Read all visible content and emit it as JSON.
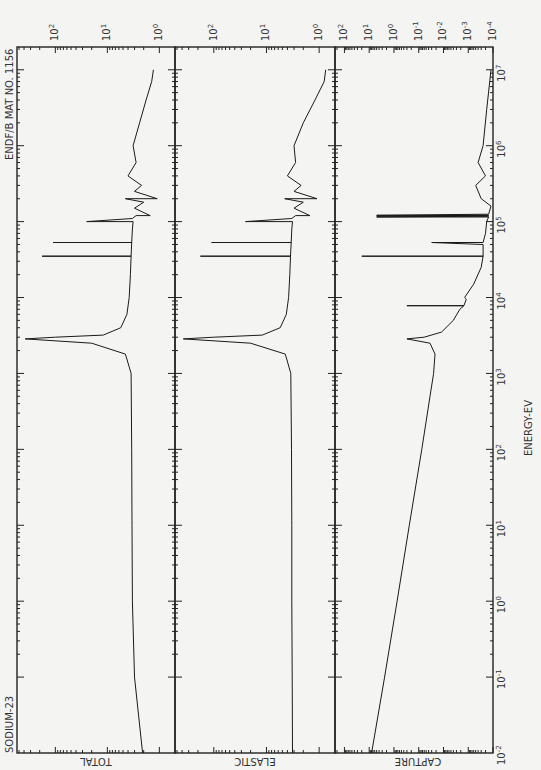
{
  "chart_data": {
    "type": "line",
    "orientation": "rotated-90-clockwise",
    "title_left": "SODIUM-23",
    "title_right": "ENDF/B MAT NO. 1156",
    "xlabel": "ENERGY-EV",
    "x_scale": "log",
    "x_range": [
      0.01,
      10000000
    ],
    "x_ticks": [
      "10^-2",
      "10^-1",
      "10^0",
      "10^1",
      "10^2",
      "10^3",
      "10^4",
      "10^5",
      "10^6",
      "10^7"
    ],
    "panels": [
      {
        "name": "TOTAL",
        "ylabel": "TOTAL",
        "y_scale": "log",
        "y_ticks": [
          "10^0",
          "10^1",
          "10^2"
        ],
        "y_range": [
          0.5,
          500
        ],
        "series": [
          {
            "name": "total cross section",
            "x": [
              0.01,
              0.1,
              1,
              10,
              100,
              1000,
              1800,
              2500,
              2850,
              3000,
              3200,
              4000,
              6000,
              10000,
              20000,
              35000,
              35000,
              35001,
              53000,
              53000,
              53001,
              80000,
              100000,
              100000,
              110000,
              120000,
              120001,
              150000,
              180000,
              200000,
              200001,
              250000,
              300000,
              400000,
              600000,
              1000000,
              2000000,
              4000000,
              7000000,
              10000000
            ],
            "y": [
              2.1,
              3.0,
              3.3,
              3.35,
              3.4,
              3.5,
              4.5,
              20,
              380,
              100,
              12,
              5.5,
              4.2,
              3.8,
              3.6,
              3.5,
              180,
              3.5,
              3.4,
              110,
              3.4,
              3.3,
              3.2,
              25,
              3.3,
              2.8,
              1.5,
              3.0,
              2.0,
              4.5,
              1.1,
              3.0,
              2.2,
              4.0,
              2.8,
              3.2,
              2.4,
              1.8,
              1.4,
              1.3
            ]
          }
        ]
      },
      {
        "name": "ELASTIC",
        "ylabel": "ELASTIC",
        "y_scale": "log",
        "y_ticks": [
          "10^0",
          "10^1",
          "10^2"
        ],
        "y_range": [
          0.5,
          500
        ],
        "series": [
          {
            "name": "elastic cross section",
            "x": [
              0.01,
              0.1,
              1,
              10,
              100,
              1000,
              1800,
              2500,
              2850,
              3000,
              3200,
              4000,
              6000,
              10000,
              20000,
              35000,
              35000,
              35001,
              53000,
              53000,
              53001,
              80000,
              100000,
              100000,
              110000,
              120000,
              120001,
              150000,
              180000,
              200000,
              200001,
              250000,
              300000,
              400000,
              600000,
              1000000,
              2000000,
              4000000,
              7000000,
              10000000
            ],
            "y": [
              3.2,
              3.25,
              3.3,
              3.3,
              3.35,
              3.45,
              4.4,
              20,
              380,
              100,
              12,
              5.5,
              4.2,
              3.8,
              3.6,
              3.5,
              180,
              3.5,
              3.4,
              110,
              3.4,
              3.3,
              3.2,
              25,
              3.3,
              2.8,
              1.5,
              3.0,
              2.0,
              4.5,
              1.1,
              3.0,
              2.2,
              4.0,
              2.8,
              3.0,
              2.0,
              1.2,
              0.8,
              0.75
            ]
          }
        ]
      },
      {
        "name": "CAPTURE",
        "ylabel": "CAPTURE",
        "y_scale": "log",
        "y_ticks": [
          "10^-4",
          "10^-3",
          "10^-2",
          "10^-1",
          "10^0",
          "10^1"
        ],
        "y_range": [
          0.0001,
          200
        ],
        "series": [
          {
            "name": "capture cross section",
            "x": [
              0.01,
              0.1,
              1,
              10,
              100,
              500,
              1000,
              1800,
              2500,
              2850,
              3000,
              3500,
              5000,
              7000,
              7800,
              7800,
              7801,
              9500,
              10000,
              15000,
              25000,
              35000,
              35000,
              35001,
              50000,
              53000,
              53001,
              70000,
              100000,
              115000,
              115000,
              118000,
              118000,
              121000,
              121000,
              125000,
              160000,
              200000,
              300000,
              400000,
              600000,
              1000000,
              3000000,
              10000000
            ],
            "y": [
              8.0,
              2.4,
              0.75,
              0.24,
              0.075,
              0.035,
              0.025,
              0.022,
              0.035,
              0.3,
              0.06,
              0.012,
              0.004,
              0.0022,
              0.0015,
              0.3,
              0.0015,
              0.0012,
              0.0014,
              0.0006,
              0.0003,
              0.00025,
              20,
              0.00025,
              0.00025,
              0.03,
              0.00025,
              0.0002,
              0.00018,
              0.00015,
              5,
              0.00015,
              5,
              0.00015,
              5,
              0.00015,
              0.00012,
              0.0003,
              0.0005,
              0.0002,
              0.0004,
              0.00025,
              0.00018,
              0.00012
            ]
          }
        ]
      }
    ]
  },
  "labels": {
    "title_left": "SODIUM-23",
    "title_right": "ENDF/B MAT NO. 1156",
    "xlabel": "ENERGY-EV",
    "panel_total": "TOTAL",
    "panel_elastic": "ELASTIC",
    "panel_capture": "CAPTURE"
  }
}
